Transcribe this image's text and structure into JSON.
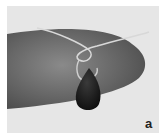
{
  "figure": {
    "panel_label": "a",
    "colors": {
      "background": "#e6e6e6",
      "finger": "#6e6e6e",
      "wire": "#d8d8d8",
      "bead": "#1a1a1a"
    }
  }
}
